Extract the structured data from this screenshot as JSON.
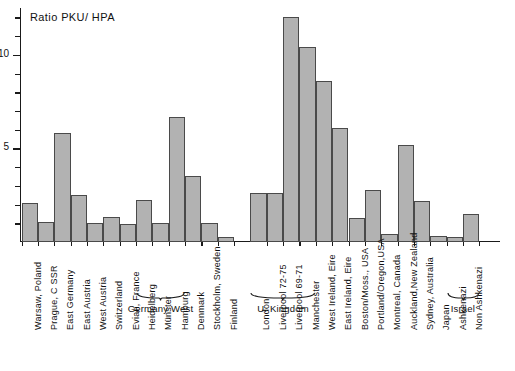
{
  "chart_data": {
    "type": "bar",
    "title": "Ratio  PKU/ HPA",
    "xlabel": "",
    "ylabel": "",
    "ylim": [
      0,
      12.5
    ],
    "grid": false,
    "legend": null,
    "y_ticks": [
      {
        "value": 5,
        "label": "5"
      },
      {
        "value": 10,
        "label": "10"
      }
    ],
    "y_minor_ticks": [
      1,
      2,
      3,
      4,
      6,
      7,
      8,
      9,
      11,
      12
    ],
    "categories": [
      "Warsaw, Poland",
      "Prague, C SSR",
      "East Germany",
      "East Austria",
      "West Austria",
      "Switzerland",
      "Evian, France",
      "Heidelberg",
      "Münster",
      "Hamburg",
      "Denmark",
      "Stockholm, Sweden",
      "Finland",
      "London",
      "Liverpool  72-75",
      "Liverpool 69-71",
      "Manchester",
      "West Ireland, Eire",
      "East Ireland, Eire",
      "Boston/Moss., USA",
      "Portland/Oregon,USA",
      "Montreal, Canada",
      "Auckland,New Zealand",
      "Sydney, Australia",
      "Japan",
      "Ashkenazi",
      "Non Ashkenazi"
    ],
    "values": [
      2.1,
      1.05,
      5.85,
      2.5,
      1.0,
      1.35,
      0.95,
      2.25,
      1.0,
      6.7,
      3.55,
      1.0,
      0.25,
      2.6,
      2.6,
      12.0,
      10.4,
      8.6,
      6.1,
      1.3,
      2.8,
      0.45,
      5.2,
      2.2,
      0.3,
      0.25,
      1.5
    ],
    "groups": [
      {
        "label": "Germany West",
        "from": 7,
        "to": 9
      },
      {
        "label": "U. Kingdom",
        "from": 13,
        "to": 16
      },
      {
        "label": "Israel",
        "from": 25,
        "to": 26
      }
    ],
    "gaps_after": [
      12
    ],
    "bar_color": "#b2b2b2",
    "bar_edge_color": "#4a4a4a",
    "axis_color": "#1a1a1a"
  }
}
